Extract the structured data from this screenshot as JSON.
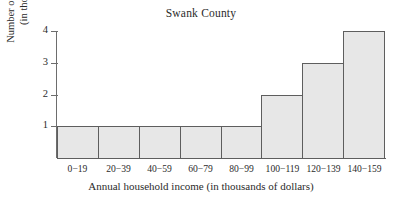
{
  "chart_data": {
    "type": "bar",
    "title": "Swank County",
    "xlabel": "Annual household income (in thousands of dollars)",
    "ylabel_lines": [
      "Number of households",
      "(in thousands)"
    ],
    "ylabel": "Number of households (in thousands)",
    "categories": [
      "0−19",
      "20−39",
      "40−59",
      "60−79",
      "80−99",
      "100−119",
      "120−139",
      "140−159"
    ],
    "values": [
      1,
      1,
      1,
      1,
      1,
      2,
      3,
      4
    ],
    "ylim": [
      0,
      4
    ],
    "ytick_labels": [
      "1",
      "2",
      "3",
      "4"
    ],
    "ytick_values": [
      1,
      2,
      3,
      4
    ],
    "xlim_note": "contiguous histogram bins, no gaps",
    "grid": false,
    "legend": null,
    "bar_fill_color": "#e7e7e7",
    "bar_border_color": "#5e5e5e",
    "axis_color": "#6d6d6d",
    "text_color": "#2b2b2b",
    "background_color": "#ffffff"
  }
}
